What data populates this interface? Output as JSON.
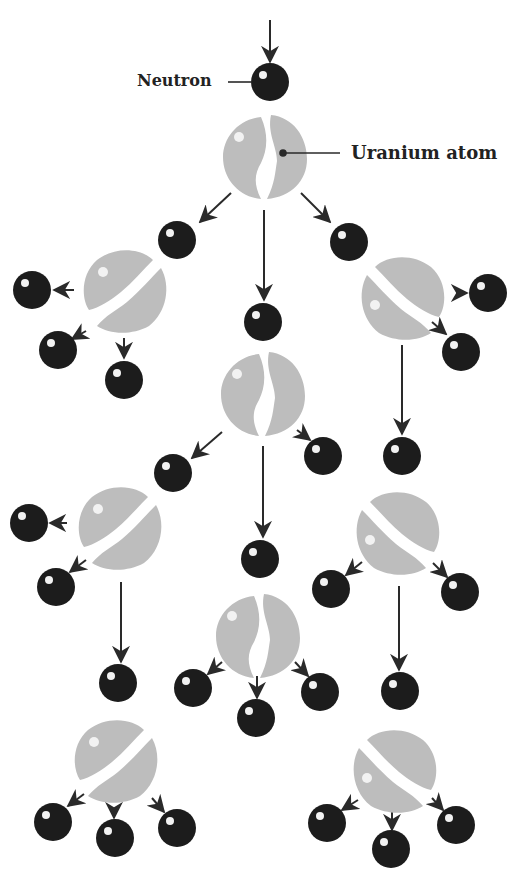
{
  "diagram": {
    "type": "nuclear fission chain reaction",
    "labels": {
      "neutron": "Neutron",
      "uranium_atom": "Uranium atom"
    },
    "colors": {
      "neutron": "#1c1c1c",
      "uranium": "#bdbdbd",
      "arrow": "#2a2a2a",
      "highlight": "#f2f2f2"
    },
    "uranium_atoms": [
      {
        "x": 265,
        "y": 157,
        "split": "vertical"
      },
      {
        "x": 125,
        "y": 290,
        "split": "diagonal"
      },
      {
        "x": 403,
        "y": 297,
        "split": "diagonal-mirror"
      },
      {
        "x": 263,
        "y": 394,
        "split": "vertical"
      },
      {
        "x": 120,
        "y": 527,
        "split": "diagonal"
      },
      {
        "x": 398,
        "y": 532,
        "split": "diagonal-mirror"
      },
      {
        "x": 258,
        "y": 636,
        "split": "vertical"
      },
      {
        "x": 116,
        "y": 760,
        "split": "diagonal"
      },
      {
        "x": 395,
        "y": 770,
        "split": "diagonal-mirror"
      }
    ],
    "neutrons": [
      {
        "x": 170,
        "y": 82
      },
      {
        "x": 177,
        "y": 240
      },
      {
        "x": 263,
        "y": 322
      },
      {
        "x": 349,
        "y": 242
      },
      {
        "x": 32,
        "y": 290
      },
      {
        "x": 58,
        "y": 350
      },
      {
        "x": 124,
        "y": 380
      },
      {
        "x": 488,
        "y": 293
      },
      {
        "x": 461,
        "y": 352
      },
      {
        "x": 402,
        "y": 456
      },
      {
        "x": 173,
        "y": 473
      },
      {
        "x": 323,
        "y": 456
      },
      {
        "x": 29,
        "y": 523
      },
      {
        "x": 56,
        "y": 587
      },
      {
        "x": 260,
        "y": 559
      },
      {
        "x": 331,
        "y": 589
      },
      {
        "x": 460,
        "y": 592
      },
      {
        "x": 118,
        "y": 683
      },
      {
        "x": 193,
        "y": 688
      },
      {
        "x": 256,
        "y": 718
      },
      {
        "x": 320,
        "y": 692
      },
      {
        "x": 400,
        "y": 691
      },
      {
        "x": 53,
        "y": 822
      },
      {
        "x": 115,
        "y": 838
      },
      {
        "x": 177,
        "y": 828
      },
      {
        "x": 327,
        "y": 823
      },
      {
        "x": 391,
        "y": 849
      },
      {
        "x": 456,
        "y": 825
      }
    ]
  }
}
